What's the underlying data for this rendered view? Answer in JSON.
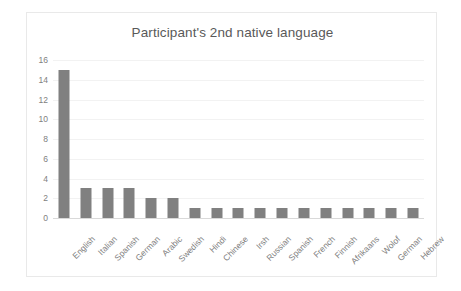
{
  "chart_data": {
    "type": "bar",
    "title": "Participant's 2nd native language",
    "xlabel": "",
    "ylabel": "",
    "categories": [
      "English",
      "Italian",
      "Spanish",
      "German",
      "Arabic",
      "Swedish",
      "Hindi",
      "Chinese",
      "Irsh",
      "Russian",
      "Spanish",
      "French",
      "Finnish",
      "Afrikaans",
      "Wolof",
      "German",
      "Hebrew"
    ],
    "values": [
      15,
      3,
      3,
      3,
      2,
      2,
      1,
      1,
      1,
      1,
      1,
      1,
      1,
      1,
      1,
      1,
      1
    ],
    "ylim": [
      0,
      16
    ],
    "yticks": [
      0,
      2,
      4,
      6,
      8,
      10,
      12,
      14,
      16
    ],
    "ytick_labels": [
      "0",
      "2",
      "4",
      "6",
      "8",
      "10",
      "12",
      "14",
      "16"
    ],
    "grid": true,
    "legend": false,
    "bar_color": "#808080",
    "title_color": "#595959",
    "tick_color": "#808080",
    "gridline_color": "#f2f2f2",
    "frame_color": "#e9e9e9",
    "background": "#ffffff"
  }
}
